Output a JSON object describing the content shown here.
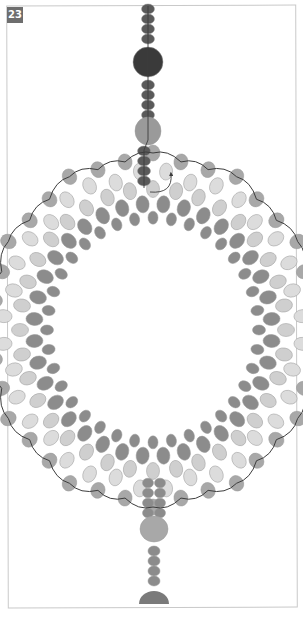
{
  "figure": {
    "step_number": "23"
  },
  "colors": {
    "badge_bg": "#6e6e6e",
    "frame": "#c9c9c9",
    "bead_dark": "#5a5a5a",
    "bead_mid": "#8c8c8c",
    "bead_outer": "#a8a8a8",
    "bead_light": "#cfcfcf",
    "bead_lightest": "#dcdcdc",
    "large_bead_black": "#3a3a3a",
    "large_bead_gray": "#9a9a9a",
    "bottom_cap": "#7a7a7a",
    "thread": "#3d3d3d"
  },
  "top_strand": {
    "x": 148,
    "beads": [
      {
        "type": "seed",
        "y": 9
      },
      {
        "type": "seed",
        "y": 19
      },
      {
        "type": "seed",
        "y": 29
      },
      {
        "type": "seed",
        "y": 39
      },
      {
        "type": "large_dark",
        "y": 62,
        "r": 15
      },
      {
        "type": "seed",
        "y": 85
      },
      {
        "type": "seed",
        "y": 95
      },
      {
        "type": "seed",
        "y": 105
      },
      {
        "type": "seed",
        "y": 115
      },
      {
        "type": "large_gray",
        "y": 131,
        "rx": 13,
        "ry": 14
      },
      {
        "type": "seed_offset",
        "y": 151
      },
      {
        "type": "seed_offset",
        "y": 161
      },
      {
        "type": "seed_offset",
        "y": 171
      },
      {
        "type": "seed_offset",
        "y": 181
      }
    ]
  },
  "ring": {
    "cx": 153,
    "cy": 330,
    "inner_r": 102,
    "rows": 5,
    "points": 12
  },
  "bottom_strand": {
    "pairs_y": [
      483,
      493,
      503,
      513
    ],
    "large_bead_y": 529,
    "seeds_y": [
      551,
      561,
      571,
      581
    ],
    "cap_y": 604
  },
  "arrow": {
    "from": [
      150,
      192
    ],
    "to": [
      171,
      174
    ]
  }
}
